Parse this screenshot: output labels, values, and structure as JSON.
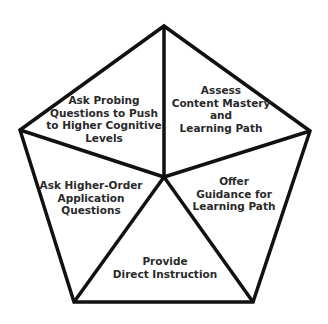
{
  "diagram": {
    "type": "pentagon-cycle",
    "colors": {
      "background": "#ffffff",
      "stroke": "#111111",
      "text": "#2a2a2a"
    },
    "segments": [
      {
        "id": "assess",
        "label": "Assess\nContent Mastery\nand\nLearning Path",
        "position": "top-right"
      },
      {
        "id": "guidance",
        "label": "Offer\nGuidance for\nLearning Path",
        "position": "right"
      },
      {
        "id": "instruction",
        "label": "Provide\nDirect Instruction",
        "position": "bottom"
      },
      {
        "id": "application",
        "label": "Ask Higher-Order\nApplication\nQuestions",
        "position": "left"
      },
      {
        "id": "probing",
        "label": "Ask Probing\nQuestions to Push\nto Higher Cognitive\nLevels",
        "position": "top-left"
      }
    ]
  }
}
